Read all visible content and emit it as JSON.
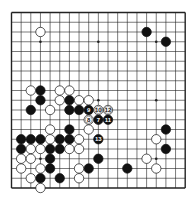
{
  "board": {
    "size": 19,
    "origin_x": 11.5,
    "origin_y": 12.5,
    "spacing_x": 9.65,
    "spacing_y": 9.75,
    "stone_radius": 4.7,
    "line_color": "#222222",
    "black_color": "#111111",
    "white_color": "#ffffff",
    "star_points": [
      [
        3,
        3
      ],
      [
        9,
        3
      ],
      [
        15,
        3
      ],
      [
        3,
        9
      ],
      [
        9,
        9
      ],
      [
        15,
        9
      ],
      [
        3,
        15
      ],
      [
        9,
        15
      ],
      [
        15,
        15
      ]
    ]
  },
  "stones": [
    {
      "c": 14,
      "r": 2,
      "color": "black"
    },
    {
      "c": 16,
      "r": 3,
      "color": "black"
    },
    {
      "c": 3,
      "r": 8,
      "color": "black"
    },
    {
      "c": 3,
      "r": 9,
      "color": "black"
    },
    {
      "c": 6,
      "r": 9,
      "color": "black"
    },
    {
      "c": 2,
      "r": 10,
      "color": "black"
    },
    {
      "c": 6,
      "r": 10,
      "color": "black"
    },
    {
      "c": 7,
      "r": 10,
      "color": "black"
    },
    {
      "c": 8,
      "r": 10,
      "color": "black",
      "label": "9"
    },
    {
      "c": 9,
      "r": 11,
      "color": "black",
      "label": "7"
    },
    {
      "c": 10,
      "r": 11,
      "color": "black",
      "label": "11"
    },
    {
      "c": 6,
      "r": 12,
      "color": "black"
    },
    {
      "c": 16,
      "r": 12,
      "color": "black"
    },
    {
      "c": 1,
      "r": 13,
      "color": "black"
    },
    {
      "c": 2,
      "r": 13,
      "color": "black"
    },
    {
      "c": 3,
      "r": 13,
      "color": "black"
    },
    {
      "c": 5,
      "r": 13,
      "color": "black"
    },
    {
      "c": 6,
      "r": 13,
      "color": "black"
    },
    {
      "c": 9,
      "r": 13,
      "color": "black",
      "label": "13"
    },
    {
      "c": 1,
      "r": 14,
      "color": "black"
    },
    {
      "c": 4,
      "r": 14,
      "color": "black"
    },
    {
      "c": 5,
      "r": 14,
      "color": "black"
    },
    {
      "c": 16,
      "r": 14,
      "color": "black"
    },
    {
      "c": 4,
      "r": 15,
      "color": "black"
    },
    {
      "c": 9,
      "r": 15,
      "color": "black"
    },
    {
      "c": 4,
      "r": 16,
      "color": "black"
    },
    {
      "c": 8,
      "r": 16,
      "color": "black"
    },
    {
      "c": 12,
      "r": 16,
      "color": "black"
    },
    {
      "c": 3,
      "r": 17,
      "color": "black"
    },
    {
      "c": 5,
      "r": 17,
      "color": "black"
    },
    {
      "c": 3,
      "r": 2,
      "color": "white"
    },
    {
      "c": 2,
      "r": 8,
      "color": "white"
    },
    {
      "c": 5,
      "r": 8,
      "color": "white"
    },
    {
      "c": 6,
      "r": 8,
      "color": "white"
    },
    {
      "c": 5,
      "r": 9,
      "color": "white"
    },
    {
      "c": 7,
      "r": 9,
      "color": "white"
    },
    {
      "c": 8,
      "r": 9,
      "color": "white"
    },
    {
      "c": 4,
      "r": 10,
      "color": "white"
    },
    {
      "c": 9,
      "r": 10,
      "color": "white",
      "label": "10"
    },
    {
      "c": 10,
      "r": 10,
      "color": "white",
      "label": "12"
    },
    {
      "c": 8,
      "r": 11,
      "color": "white",
      "label": "8"
    },
    {
      "c": 4,
      "r": 12,
      "color": "white"
    },
    {
      "c": 8,
      "r": 12,
      "color": "white"
    },
    {
      "c": 4,
      "r": 13,
      "color": "white"
    },
    {
      "c": 7,
      "r": 13,
      "color": "white"
    },
    {
      "c": 15,
      "r": 13,
      "color": "white"
    },
    {
      "c": 2,
      "r": 14,
      "color": "white"
    },
    {
      "c": 3,
      "r": 14,
      "color": "white"
    },
    {
      "c": 6,
      "r": 14,
      "color": "white"
    },
    {
      "c": 7,
      "r": 14,
      "color": "white"
    },
    {
      "c": 1,
      "r": 15,
      "color": "white"
    },
    {
      "c": 2,
      "r": 15,
      "color": "white"
    },
    {
      "c": 14,
      "r": 15,
      "color": "white"
    },
    {
      "c": 1,
      "r": 16,
      "color": "white"
    },
    {
      "c": 3,
      "r": 16,
      "color": "white"
    },
    {
      "c": 7,
      "r": 16,
      "color": "white"
    },
    {
      "c": 15,
      "r": 16,
      "color": "white"
    },
    {
      "c": 2,
      "r": 17,
      "color": "white"
    },
    {
      "c": 7,
      "r": 17,
      "color": "white"
    },
    {
      "c": 3,
      "r": 18,
      "color": "white"
    }
  ]
}
